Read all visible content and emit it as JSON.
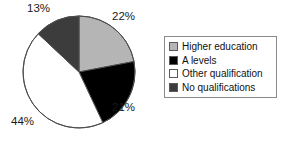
{
  "chart_data": {
    "type": "pie",
    "title": "",
    "subtitle": "",
    "xlabel": "",
    "ylabel": "",
    "grid": false,
    "legend_position": "right",
    "start_angle_deg": 0,
    "direction": "clockwise",
    "categories": [
      "Higher education",
      "A levels",
      "Other qualification",
      "No qualifications"
    ],
    "values": [
      22,
      21,
      44,
      13
    ],
    "value_labels": [
      "22%",
      "21%",
      "44%",
      "13%"
    ],
    "colors": [
      "#b5b5b5",
      "#000000",
      "#ffffff",
      "#3c3c3c"
    ],
    "slices": [
      {
        "label": "Higher education",
        "value": 22,
        "value_label": "22%",
        "color": "#b5b5b5",
        "swatch_name": "legend-swatch-higher-education"
      },
      {
        "label": "A levels",
        "value": 21,
        "value_label": "21%",
        "color": "#000000",
        "swatch_name": "legend-swatch-a-levels"
      },
      {
        "label": "Other qualification",
        "value": 44,
        "value_label": "44%",
        "color": "#ffffff",
        "swatch_name": "legend-swatch-other-qualification"
      },
      {
        "label": "No qualifications",
        "value": 13,
        "value_label": "13%",
        "color": "#3c3c3c",
        "swatch_name": "legend-swatch-no-qualifications"
      }
    ]
  },
  "pie": {
    "center_x": 79,
    "center_y": 72,
    "radius": 56,
    "outline_color": "#4d4d4d"
  },
  "labels": {
    "higher_education_pct": "22%",
    "a_levels_pct": "21%",
    "other_qualification_pct": "44%",
    "no_qualifications_pct": "13%"
  },
  "legend": {
    "items": [
      {
        "label": "Higher education",
        "color": "#b5b5b5"
      },
      {
        "label": "A levels",
        "color": "#000000"
      },
      {
        "label": "Other qualification",
        "color": "#ffffff"
      },
      {
        "label": "No qualifications",
        "color": "#3c3c3c"
      }
    ]
  }
}
